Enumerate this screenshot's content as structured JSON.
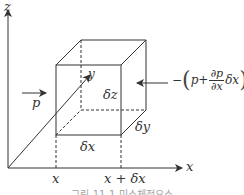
{
  "diagram": {
    "type": "differential fluid element (control volume) with pressure forces",
    "axes": {
      "z_label": "z",
      "x_label": "x",
      "y_label": "y"
    },
    "element": {
      "dx_label": "δx",
      "dy_label": "δy",
      "dz_label": "δz"
    },
    "positions": {
      "x_start": "x",
      "x_end": "x + δx"
    },
    "forces": {
      "left_label": "p",
      "right_sign": "−",
      "right_p": "p",
      "right_plus": "+",
      "right_num": "∂p",
      "right_den": "∂x",
      "right_dx": "δx"
    },
    "caption": "그림 11-1 미소체적요소",
    "caption_note": "Caption is blurry and clipped at the bottom edge; text is an uncertain reading"
  }
}
